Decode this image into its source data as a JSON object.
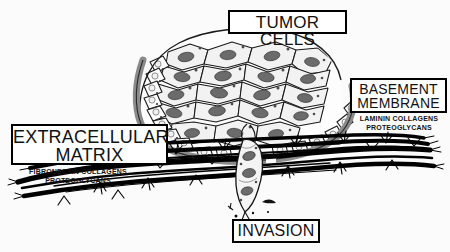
{
  "figure": {
    "background_color": "#fbfbfc",
    "ink_color": "#000000",
    "membrane_color": "#8a8a8a",
    "nucleus_color": "#6b6b6b"
  },
  "labels": {
    "tumor_cells": "TUMOR CELLS",
    "basement_membrane_line1": "BASEMENT",
    "basement_membrane_line2": "MEMBRANE",
    "extracellular_matrix_line1": "EXTRACELLULAR",
    "extracellular_matrix_line2": "MATRIX",
    "invasion": "INVASION"
  },
  "basement_membrane_components": {
    "item1": "LAMININ",
    "item2": "COLLAGENS",
    "item3": "PROTEOGLYCANS"
  },
  "extracellular_matrix_components": {
    "item1": "FIBRONECTIN",
    "item2": "COLLAGENS",
    "item3": "PROTEOGLYCANS"
  },
  "structures": {
    "tumor_mass": "tumor-cell-mass",
    "membrane_band": "basement-membrane-band",
    "matrix_fibers": "extracellular-matrix-fibers",
    "invading_cell": "invading-tumor-cell",
    "cell_fragments": "detached-cell-fragments"
  }
}
